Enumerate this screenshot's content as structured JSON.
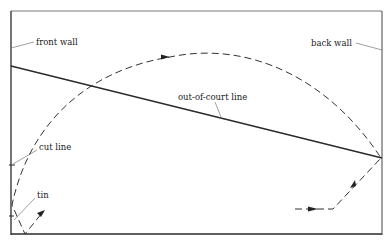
{
  "diagram": {
    "labels": {
      "front_wall": "front wall",
      "back_wall": "back wall",
      "out_of_court_line": "out-of-court line",
      "cut_line": "cut line",
      "tin": "tin"
    },
    "colors": {
      "line": "#2a2a2a",
      "leader": "#777777",
      "background": "#ffffff"
    }
  }
}
